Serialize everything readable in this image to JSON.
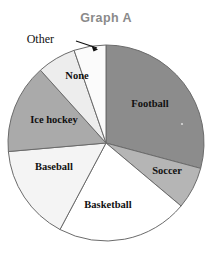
{
  "figure": {
    "title": "Graph A",
    "title_color": "#8a8a8a",
    "background_color": "#ffffff",
    "outline_color": "#6b6b6b"
  },
  "callout": {
    "label": "Other",
    "leader_icon": "arrow-pointer-icon"
  },
  "chart_data": {
    "type": "pie",
    "title": "Graph A",
    "xlabel": "",
    "ylabel": "",
    "legend": "none",
    "grid": false,
    "labels_inside_slices": true,
    "start_angle_deg": 0,
    "direction": "clockwise",
    "categories": [
      "Football",
      "Soccer",
      "Basketball",
      "Baseball",
      "Ice hockey",
      "None",
      "Other"
    ],
    "values": [
      29,
      7,
      22,
      16,
      15,
      6,
      5
    ],
    "slices": [
      {
        "label": "Football",
        "value": 29,
        "start_angle": 0,
        "end_angle": 105,
        "color": "#8c8c8c",
        "label_x": 150,
        "label_y": 105
      },
      {
        "label": "Soccer",
        "value": 7,
        "start_angle": 105,
        "end_angle": 130,
        "color": "#b5b5b5",
        "label_x": 167,
        "label_y": 172
      },
      {
        "label": "Basketball",
        "value": 22,
        "start_angle": 130,
        "end_angle": 208,
        "color": "#ffffff",
        "label_x": 108,
        "label_y": 206
      },
      {
        "label": "Baseball",
        "value": 16,
        "start_angle": 208,
        "end_angle": 265,
        "color": "#f4f4f4",
        "label_x": 54,
        "label_y": 168
      },
      {
        "label": "Ice hockey",
        "value": 15,
        "start_angle": 265,
        "end_angle": 318,
        "color": "#aaaaaa",
        "label_x": 54,
        "label_y": 121
      },
      {
        "label": "None",
        "value": 6,
        "start_angle": 318,
        "end_angle": 341,
        "color": "#ededed",
        "label_x": 77,
        "label_y": 77
      },
      {
        "label": "Other",
        "value": 5,
        "start_angle": 341,
        "end_angle": 360,
        "color": "#fbfbfb",
        "label_x": 56,
        "label_y": 43
      }
    ],
    "geometry": {
      "center_x": 106,
      "center_y": 143,
      "radius": 98
    }
  }
}
